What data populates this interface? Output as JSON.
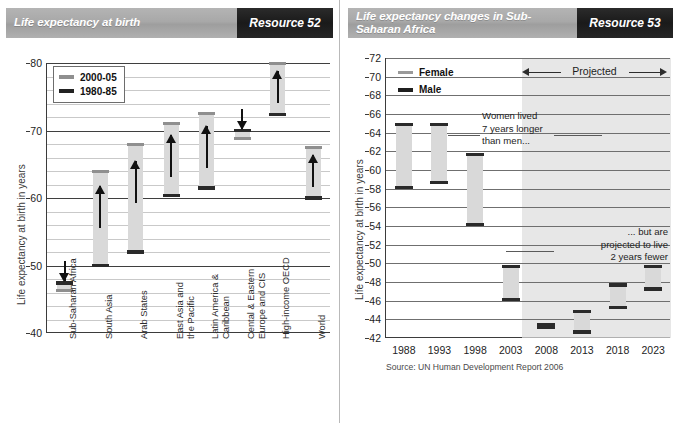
{
  "left_panel": {
    "banner": {
      "title": "Life expectancy at birth",
      "tag": "Resource 52"
    },
    "chart_data": {
      "type": "bar",
      "title": "Life expectancy at birth",
      "ylabel": "Life expectancy at birth in years",
      "xlabel": "",
      "ylim": [
        40,
        80
      ],
      "ytick_step": 2,
      "yticks_labeled": [
        40,
        50,
        60,
        70,
        80
      ],
      "grid": true,
      "legend": [
        "2000-05",
        "1980-85"
      ],
      "legend_position": "top-left",
      "categories": [
        "Sub-Saharan Africa",
        "South Asia",
        "Arab States",
        "East Asia and\nthe Pacific",
        "Latin America &\nCaribbean",
        "Cental & Eastern\nEurope and CIS",
        "High-income OECD",
        "World"
      ],
      "series": [
        {
          "name": "1980-85",
          "values": [
            47.4,
            50.0,
            52.0,
            60.4,
            61.5,
            70.0,
            72.4,
            60.0
          ]
        },
        {
          "name": "2000-05",
          "values": [
            46.3,
            64.0,
            68.0,
            71.0,
            72.5,
            68.8,
            80.0,
            67.5
          ]
        }
      ],
      "direction": [
        "down",
        "up",
        "up",
        "up",
        "up",
        "down",
        "up",
        "up"
      ]
    }
  },
  "right_panel": {
    "banner": {
      "title": "Life expectancy changes in Sub-Saharan Africa",
      "tag": "Resource 53"
    },
    "chart_data": {
      "type": "bar",
      "title": "Life expectancy changes in Sub-Saharan Africa",
      "ylabel": "Life expectancy at birth in years",
      "xlabel": "",
      "ylim": [
        42,
        72
      ],
      "ytick_step": 2,
      "yticks_labeled": [
        42,
        44,
        46,
        48,
        50,
        52,
        54,
        56,
        58,
        60,
        62,
        64,
        66,
        68,
        70,
        72
      ],
      "grid": true,
      "legend": [
        "Female",
        "Male"
      ],
      "legend_position": "top-left",
      "categories": [
        "1988",
        "1993",
        "1998",
        "2003",
        "2008",
        "2013",
        "2018",
        "2023"
      ],
      "series": [
        {
          "name": "Female",
          "values": [
            65.0,
            65.0,
            61.8,
            49.8,
            43.6,
            45.0,
            47.8,
            49.8
          ]
        },
        {
          "name": "Male",
          "values": [
            58.0,
            58.5,
            54.0,
            46.0,
            43.0,
            42.5,
            45.1,
            47.1
          ]
        }
      ],
      "projected_from": "2008",
      "projected_label": "Projected",
      "annotations": [
        {
          "text": "Women lived\n7 years longer\nthan men...",
          "anchor": "1998"
        },
        {
          "text": "... but are\nprojected to live\n2 years fewer",
          "anchor": "2023"
        }
      ],
      "source": "Source: UN Human Development Report 2006"
    }
  }
}
